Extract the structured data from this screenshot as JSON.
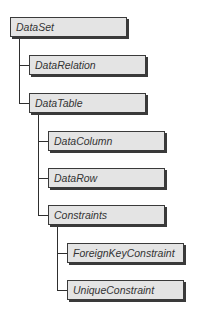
{
  "diagram": {
    "nodes": [
      {
        "id": "dataset",
        "label": "DataSet",
        "level": 0
      },
      {
        "id": "datarelation",
        "label": "DataRelation",
        "level": 1,
        "parent": "dataset"
      },
      {
        "id": "datatable",
        "label": "DataTable",
        "level": 1,
        "parent": "dataset"
      },
      {
        "id": "datacolumn",
        "label": "DataColumn",
        "level": 2,
        "parent": "datatable"
      },
      {
        "id": "datarow",
        "label": "DataRow",
        "level": 2,
        "parent": "datatable"
      },
      {
        "id": "constraints",
        "label": "Constraints",
        "level": 2,
        "parent": "datatable"
      },
      {
        "id": "foreignkeyconstraint",
        "label": "ForeignKeyConstraint",
        "level": 3,
        "parent": "constraints"
      },
      {
        "id": "uniqueconstraint",
        "label": "UniqueConstraint",
        "level": 3,
        "parent": "constraints"
      }
    ],
    "colors": {
      "box_fill": "#e4e4e4",
      "box_border": "#3a3a3a",
      "connector": "#2e2e2e",
      "text": "#333333"
    }
  }
}
